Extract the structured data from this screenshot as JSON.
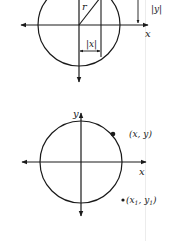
{
  "figure": {
    "top_diagram": {
      "labels": {
        "radius": "r",
        "abs_x": "|x|",
        "abs_y": "|y|",
        "x_axis": "x"
      }
    },
    "bottom_diagram": {
      "labels": {
        "y_axis": "y",
        "x_axis": "x",
        "point_on_circle": "(x, y)",
        "point_outside_prefix": "(x",
        "point_outside_sub1": "1",
        "point_outside_mid": ", y",
        "point_outside_sub2": "1",
        "point_outside_suffix": ")"
      }
    }
  },
  "colors": {
    "ink": "#1a1a1a",
    "background": "#ffffff"
  }
}
